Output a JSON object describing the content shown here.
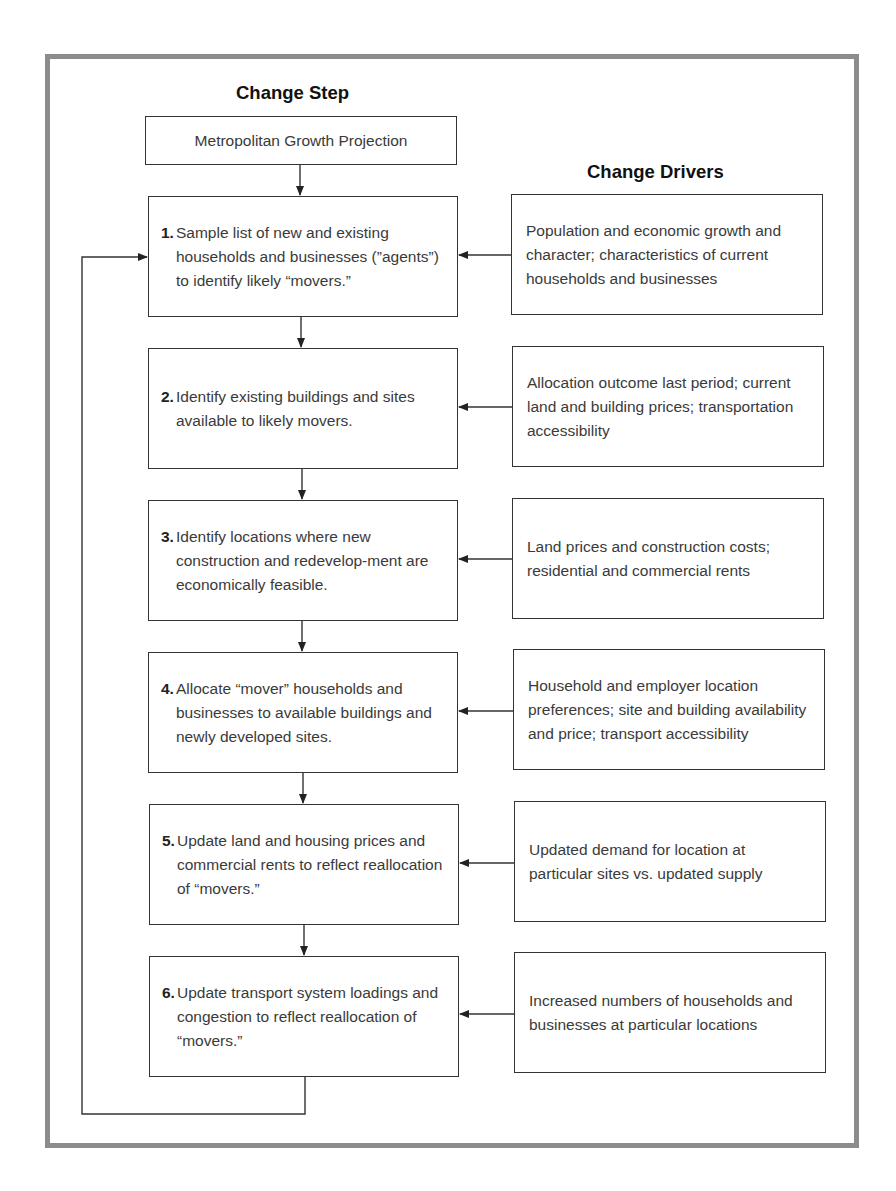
{
  "headings": {
    "steps": "Change Step",
    "drivers": "Change Drivers"
  },
  "top_box": {
    "label": "Metropolitan Growth Projection"
  },
  "steps": [
    {
      "num": "1.",
      "text": "Sample list of new and existing households and businesses (”agents”) to identify likely “movers.”"
    },
    {
      "num": "2.",
      "text": "Identify existing buildings and sites available to likely movers."
    },
    {
      "num": "3.",
      "text": "Identify locations where new construction and redevelop-ment are economically feasible."
    },
    {
      "num": "4.",
      "text": "Allocate “mover” households and businesses to available buildings and newly developed sites."
    },
    {
      "num": "5.",
      "text": "Update land and housing prices and commercial rents to reflect reallocation of “movers.”"
    },
    {
      "num": "6.",
      "text": "Update transport system loadings and congestion to reflect reallocation of “movers.”"
    }
  ],
  "drivers": [
    {
      "text": "Population and economic growth and character; characteristics of current households and businesses"
    },
    {
      "text": "Allocation outcome last period; current land and building prices; transportation accessibility"
    },
    {
      "text": "Land prices and construction costs; residential and commercial rents"
    },
    {
      "text": "Household and employer location preferences; site and building availability and price; transport accessibility"
    },
    {
      "text": "Updated demand for location at particular sites vs. updated supply"
    },
    {
      "text": "Increased numbers of households and businesses at particular locations"
    }
  ],
  "colors": {
    "frame": "#8c8c8c",
    "box_border": "#333333",
    "text": "#3a3a3a"
  }
}
